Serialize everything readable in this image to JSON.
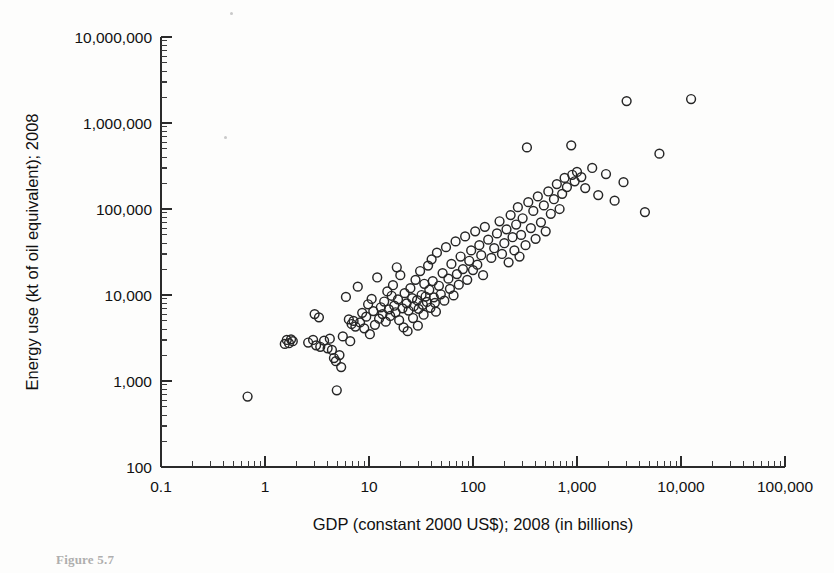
{
  "figure": {
    "caption": "Figure 5.7",
    "background_color": "#fdfdfc",
    "marker_color": "#262626",
    "axis_color": "#2b2b2b"
  },
  "chart_data": {
    "type": "scatter",
    "title": "",
    "subtitle": "",
    "xlabel": "GDP (constant 2000 US$); 2008 (in billions)",
    "ylabel": "Energy use (kt of oil equivalent); 2008",
    "xscale": "log",
    "yscale": "log",
    "xlim": [
      0.1,
      100000
    ],
    "ylim": [
      100,
      10000000
    ],
    "grid": false,
    "legend": null,
    "legend_position": "none",
    "x_tick_labels": [
      "0.1",
      "1",
      "10",
      "100",
      "1,000",
      "10,000",
      "100,000"
    ],
    "x_tick_values": [
      0.1,
      1,
      10,
      100,
      1000,
      10000,
      100000
    ],
    "y_tick_labels": [
      "100",
      "1,000",
      "10,000",
      "100,000",
      "1,000,000",
      "10,000,000"
    ],
    "y_tick_values": [
      100,
      1000,
      10000,
      100000,
      1000000,
      10000000
    ],
    "minor_ticks": true,
    "marker": "open-circle",
    "marker_size_px": 10,
    "n_points": 152,
    "annotations": [],
    "points": [
      [
        0.68,
        660
      ],
      [
        1.55,
        2700
      ],
      [
        1.62,
        3000
      ],
      [
        1.7,
        2750
      ],
      [
        1.78,
        3050
      ],
      [
        1.85,
        2900
      ],
      [
        2.6,
        2800
      ],
      [
        2.9,
        3000
      ],
      [
        3.1,
        2600
      ],
      [
        3.4,
        2500
      ],
      [
        3.7,
        2950
      ],
      [
        4.0,
        2400
      ],
      [
        4.2,
        3100
      ],
      [
        4.4,
        2300
      ],
      [
        4.6,
        1850
      ],
      [
        4.8,
        1700
      ],
      [
        4.9,
        780
      ],
      [
        5.2,
        2000
      ],
      [
        5.4,
        1450
      ],
      [
        6.0,
        9500
      ],
      [
        6.4,
        5200
      ],
      [
        6.8,
        4600
      ],
      [
        7.1,
        5000
      ],
      [
        7.4,
        4300
      ],
      [
        7.8,
        12500
      ],
      [
        8.2,
        4800
      ],
      [
        8.6,
        6200
      ],
      [
        9.0,
        4100
      ],
      [
        9.4,
        5600
      ],
      [
        9.8,
        7800
      ],
      [
        10.2,
        3500
      ],
      [
        10.6,
        9000
      ],
      [
        11.0,
        6500
      ],
      [
        11.4,
        4500
      ],
      [
        12.0,
        16000
      ],
      [
        12.5,
        5300
      ],
      [
        13.0,
        7200
      ],
      [
        13.5,
        6000
      ],
      [
        14.0,
        8400
      ],
      [
        14.5,
        4900
      ],
      [
        15.0,
        11000
      ],
      [
        15.5,
        6800
      ],
      [
        16.0,
        5700
      ],
      [
        16.5,
        9800
      ],
      [
        17.0,
        13000
      ],
      [
        17.5,
        7500
      ],
      [
        18.0,
        6300
      ],
      [
        18.5,
        21000
      ],
      [
        19.0,
        8900
      ],
      [
        19.5,
        5100
      ],
      [
        20.0,
        17000
      ],
      [
        21.0,
        7000
      ],
      [
        22.0,
        10500
      ],
      [
        23.0,
        8000
      ],
      [
        24.0,
        6600
      ],
      [
        25.0,
        12000
      ],
      [
        26.0,
        9200
      ],
      [
        27.0,
        7400
      ],
      [
        28.0,
        15000
      ],
      [
        29.0,
        8700
      ],
      [
        30.0,
        6900
      ],
      [
        31.0,
        19000
      ],
      [
        32.0,
        10000
      ],
      [
        33.0,
        7700
      ],
      [
        34.0,
        13500
      ],
      [
        35.0,
        9600
      ],
      [
        36.0,
        8300
      ],
      [
        37.0,
        22000
      ],
      [
        38.0,
        11500
      ],
      [
        39.0,
        7100
      ],
      [
        40.0,
        26000
      ],
      [
        41.0,
        14500
      ],
      [
        42.0,
        9400
      ],
      [
        43.0,
        8100
      ],
      [
        45.0,
        31000
      ],
      [
        47.0,
        12800
      ],
      [
        49.0,
        10200
      ],
      [
        51.0,
        18000
      ],
      [
        53.0,
        8600
      ],
      [
        55.0,
        36000
      ],
      [
        58.0,
        15500
      ],
      [
        60.0,
        11800
      ],
      [
        62.0,
        23000
      ],
      [
        65.0,
        9900
      ],
      [
        68.0,
        42000
      ],
      [
        70.0,
        17500
      ],
      [
        73.0,
        13200
      ],
      [
        76.0,
        28000
      ],
      [
        80.0,
        20000
      ],
      [
        84.0,
        48000
      ],
      [
        88.0,
        15000
      ],
      [
        92.0,
        25000
      ],
      [
        96.0,
        33000
      ],
      [
        100.0,
        19500
      ],
      [
        105.0,
        55000
      ],
      [
        110.0,
        22500
      ],
      [
        115.0,
        38000
      ],
      [
        120.0,
        29000
      ],
      [
        125.0,
        17000
      ],
      [
        130.0,
        62000
      ],
      [
        140.0,
        44000
      ],
      [
        150.0,
        27000
      ],
      [
        160.0,
        35000
      ],
      [
        170.0,
        52000
      ],
      [
        180.0,
        72000
      ],
      [
        190.0,
        30000
      ],
      [
        200.0,
        40000
      ],
      [
        210.0,
        58000
      ],
      [
        220.0,
        24000
      ],
      [
        230.0,
        85000
      ],
      [
        240.0,
        47000
      ],
      [
        250.0,
        33000
      ],
      [
        260.0,
        66000
      ],
      [
        270.0,
        105000
      ],
      [
        280.0,
        28000
      ],
      [
        290.0,
        50000
      ],
      [
        300.0,
        78000
      ],
      [
        320.0,
        38000
      ],
      [
        340.0,
        120000
      ],
      [
        360.0,
        60000
      ],
      [
        380.0,
        95000
      ],
      [
        400.0,
        45000
      ],
      [
        420.0,
        140000
      ],
      [
        450.0,
        70000
      ],
      [
        480.0,
        110000
      ],
      [
        500.0,
        55000
      ],
      [
        530.0,
        160000
      ],
      [
        560.0,
        88000
      ],
      [
        600.0,
        130000
      ],
      [
        640.0,
        195000
      ],
      [
        680.0,
        100000
      ],
      [
        720.0,
        150000
      ],
      [
        760.0,
        230000
      ],
      [
        800.0,
        180000
      ],
      [
        330.0,
        520000
      ],
      [
        880.0,
        550000
      ],
      [
        900.0,
        250000
      ],
      [
        950.0,
        210000
      ],
      [
        1000.0,
        270000
      ],
      [
        1100.0,
        235000
      ],
      [
        1200.0,
        175000
      ],
      [
        1400.0,
        300000
      ],
      [
        1600.0,
        145000
      ],
      [
        1900.0,
        255000
      ],
      [
        2300.0,
        125000
      ],
      [
        2800.0,
        205000
      ],
      [
        3000.0,
        1800000
      ],
      [
        4500.0,
        92000
      ],
      [
        6200.0,
        440000
      ],
      [
        12500.0,
        1900000
      ],
      [
        3.0,
        6000
      ],
      [
        3.3,
        5500
      ],
      [
        5.6,
        3300
      ],
      [
        6.6,
        2900
      ],
      [
        21.5,
        4200
      ],
      [
        23.5,
        3800
      ],
      [
        26.5,
        5400
      ],
      [
        29.5,
        4400
      ],
      [
        33.5,
        5900
      ],
      [
        44.0,
        6400
      ]
    ]
  }
}
